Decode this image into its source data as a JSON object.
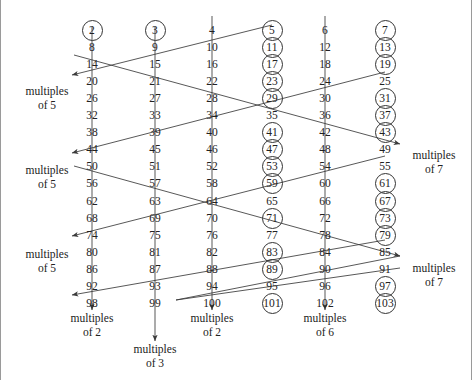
{
  "diagram": {
    "columns": [
      {
        "id": "col-2",
        "start": 2,
        "step": 6,
        "numbers": [
          2,
          8,
          14,
          20,
          26,
          32,
          38,
          44,
          50,
          56,
          62,
          68,
          74,
          80,
          86,
          92,
          98
        ],
        "circled": [
          2
        ],
        "axis_label": {
          "line1": "multiples",
          "line2": "of 2"
        }
      },
      {
        "id": "col-3",
        "start": 3,
        "step": 6,
        "numbers": [
          3,
          9,
          15,
          21,
          27,
          33,
          39,
          45,
          51,
          57,
          63,
          69,
          75,
          81,
          87,
          93,
          99
        ],
        "circled": [
          3
        ],
        "axis_label": {
          "line1": "multiples",
          "line2": "of 3"
        }
      },
      {
        "id": "col-4",
        "start": 4,
        "step": 6,
        "numbers": [
          4,
          10,
          16,
          22,
          28,
          34,
          40,
          46,
          52,
          58,
          64,
          70,
          76,
          82,
          88,
          94,
          100
        ],
        "circled": [],
        "axis_label": {
          "line1": "multiples",
          "line2": "of 2"
        }
      },
      {
        "id": "col-5",
        "start": 5,
        "step": 6,
        "numbers": [
          5,
          11,
          17,
          23,
          29,
          35,
          41,
          47,
          53,
          59,
          65,
          71,
          77,
          83,
          89,
          95,
          101
        ],
        "circled": [
          5,
          11,
          17,
          23,
          29,
          41,
          47,
          53,
          59,
          71,
          83,
          89,
          101
        ],
        "axis_label": null
      },
      {
        "id": "col-6",
        "start": 6,
        "step": 6,
        "numbers": [
          6,
          12,
          18,
          24,
          30,
          36,
          42,
          48,
          54,
          60,
          66,
          72,
          78,
          84,
          90,
          96,
          102
        ],
        "circled": [],
        "axis_label": {
          "line1": "multiples",
          "line2": "of 6"
        }
      },
      {
        "id": "col-7",
        "start": 7,
        "step": 6,
        "numbers": [
          7,
          13,
          19,
          25,
          31,
          37,
          43,
          49,
          55,
          61,
          67,
          73,
          79,
          85,
          91,
          97,
          103
        ],
        "circled": [
          7,
          13,
          19,
          31,
          37,
          43,
          61,
          67,
          73,
          79,
          97,
          103
        ],
        "axis_label": null
      }
    ],
    "diagonal_labels": {
      "five_left": {
        "line1": "multiples",
        "line2": "of 5"
      },
      "seven_right": {
        "line1": "multiples",
        "line2": "of 7"
      }
    },
    "labels": {
      "multiples_of_5_a": {
        "line1": "multiples",
        "line2": "of 5"
      },
      "multiples_of_5_b": {
        "line1": "multiples",
        "line2": "of 5"
      },
      "multiples_of_5_c": {
        "line1": "multiples",
        "line2": "of 5"
      },
      "multiples_of_7_a": {
        "line1": "multiples",
        "line2": "of 7"
      },
      "multiples_of_7_b": {
        "line1": "multiples",
        "line2": "of 7"
      },
      "multiples_of_2_a": {
        "line1": "multiples",
        "line2": "of 2"
      },
      "multiples_of_3": {
        "line1": "multiples",
        "line2": "of 3"
      },
      "multiples_of_2_b": {
        "line1": "multiples",
        "line2": "of 2"
      },
      "multiples_of_6": {
        "line1": "multiples",
        "line2": "of 6"
      }
    },
    "colors": {
      "ink": "#222222",
      "line": "#3a3a3a",
      "frame": "#9a9a9a",
      "background": "#ffffff"
    }
  }
}
